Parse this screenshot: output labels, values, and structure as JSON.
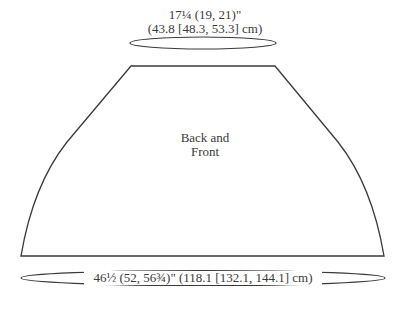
{
  "diagram": {
    "piece": {
      "label_lines": [
        "Back and",
        "Front"
      ]
    },
    "measurements": {
      "top_width": {
        "line1": "17¼ (19, 21)\"",
        "line2": "(43.8 [48.3, 53.3] cm)"
      },
      "bottom_width": {
        "text": "46½ (52, 56¾)\" (118.1 [132.1, 144.1] cm)"
      }
    },
    "colors": {
      "stroke": "#3a3a3a",
      "background": "#ffffff",
      "text": "#3a3a3a"
    }
  }
}
